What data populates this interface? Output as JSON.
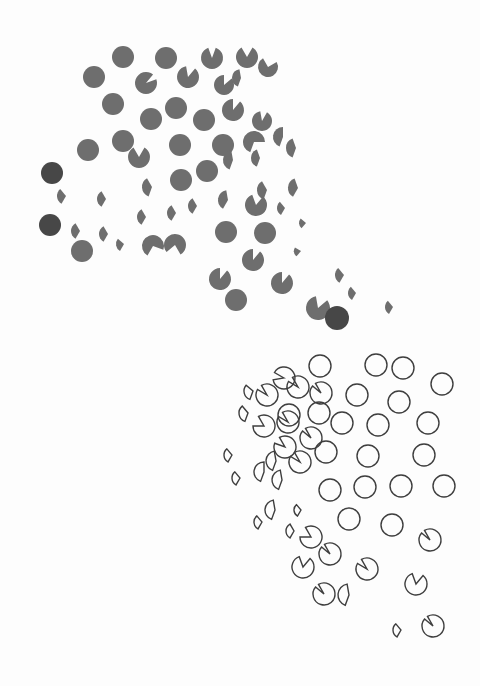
{
  "artwork": {
    "description": "Abstract composition: grey filled discs and pac-man sectors (upper-left) transitioning to outlined circles and sectors (lower-right)",
    "colors": {
      "background": "#fdfdfd",
      "fill": "#6e6e6e",
      "fill_dark": "#474747",
      "stroke": "#3e3e3e"
    },
    "filled_shapes": [
      {
        "cx": 123,
        "cy": 57,
        "r": 11,
        "start": 0,
        "sweep": 360
      },
      {
        "cx": 166,
        "cy": 58,
        "r": 11,
        "start": 0,
        "sweep": 360
      },
      {
        "cx": 212,
        "cy": 58,
        "r": 11,
        "start": 20,
        "sweep": 320
      },
      {
        "cx": 247,
        "cy": 57,
        "r": 11,
        "start": 30,
        "sweep": 300
      },
      {
        "cx": 268,
        "cy": 67,
        "r": 10,
        "start": 60,
        "sweep": 270
      },
      {
        "cx": 94,
        "cy": 77,
        "r": 11,
        "start": 0,
        "sweep": 360
      },
      {
        "cx": 146,
        "cy": 83,
        "r": 11,
        "start": 70,
        "sweep": 330
      },
      {
        "cx": 188,
        "cy": 77,
        "r": 11,
        "start": 40,
        "sweep": 310
      },
      {
        "cx": 224,
        "cy": 85,
        "r": 10,
        "start": 50,
        "sweep": 310
      },
      {
        "cx": 241,
        "cy": 78,
        "r": 9,
        "start": 200,
        "sweep": 150
      },
      {
        "cx": 113,
        "cy": 104,
        "r": 11,
        "start": 0,
        "sweep": 360
      },
      {
        "cx": 151,
        "cy": 119,
        "r": 11,
        "start": 0,
        "sweep": 360
      },
      {
        "cx": 176,
        "cy": 108,
        "r": 11,
        "start": 0,
        "sweep": 360
      },
      {
        "cx": 204,
        "cy": 120,
        "r": 11,
        "start": 0,
        "sweep": 360
      },
      {
        "cx": 233,
        "cy": 110,
        "r": 11,
        "start": 40,
        "sweep": 320
      },
      {
        "cx": 262,
        "cy": 121,
        "r": 10,
        "start": 30,
        "sweep": 320
      },
      {
        "cx": 123,
        "cy": 141,
        "r": 11,
        "start": 0,
        "sweep": 360
      },
      {
        "cx": 139,
        "cy": 157,
        "r": 11,
        "start": 30,
        "sweep": 300
      },
      {
        "cx": 88,
        "cy": 150,
        "r": 11,
        "start": 0,
        "sweep": 360
      },
      {
        "cx": 180,
        "cy": 145,
        "r": 11,
        "start": 0,
        "sweep": 360
      },
      {
        "cx": 223,
        "cy": 145,
        "r": 11,
        "start": 0,
        "sweep": 360
      },
      {
        "cx": 254,
        "cy": 142,
        "r": 11,
        "start": 200,
        "sweep": 250
      },
      {
        "cx": 283,
        "cy": 137,
        "r": 10,
        "start": 200,
        "sweep": 160
      },
      {
        "cx": 233,
        "cy": 160,
        "r": 10,
        "start": 200,
        "sweep": 150
      },
      {
        "cx": 260,
        "cy": 158,
        "r": 9,
        "start": 200,
        "sweep": 140
      },
      {
        "cx": 296,
        "cy": 148,
        "r": 10,
        "start": 200,
        "sweep": 140
      },
      {
        "cx": 207,
        "cy": 171,
        "r": 11,
        "start": 0,
        "sweep": 360
      },
      {
        "cx": 181,
        "cy": 180,
        "r": 11,
        "start": 0,
        "sweep": 360
      },
      {
        "cx": 152,
        "cy": 187,
        "r": 10,
        "start": 200,
        "sweep": 130
      },
      {
        "cx": 267,
        "cy": 190,
        "r": 10,
        "start": 200,
        "sweep": 130
      },
      {
        "cx": 228,
        "cy": 200,
        "r": 10,
        "start": 210,
        "sweep": 140
      },
      {
        "cx": 298,
        "cy": 188,
        "r": 10,
        "start": 210,
        "sweep": 130
      },
      {
        "cx": 256,
        "cy": 205,
        "r": 11,
        "start": 40,
        "sweep": 300
      },
      {
        "cx": 285,
        "cy": 208,
        "r": 8,
        "start": 210,
        "sweep": 110
      },
      {
        "cx": 66,
        "cy": 196,
        "r": 9,
        "start": 210,
        "sweep": 110
      },
      {
        "cx": 106,
        "cy": 199,
        "r": 9,
        "start": 210,
        "sweep": 120
      },
      {
        "cx": 146,
        "cy": 217,
        "r": 9,
        "start": 210,
        "sweep": 120
      },
      {
        "cx": 176,
        "cy": 213,
        "r": 9,
        "start": 210,
        "sweep": 120
      },
      {
        "cx": 197,
        "cy": 206,
        "r": 9,
        "start": 210,
        "sweep": 120
      },
      {
        "cx": 226,
        "cy": 232,
        "r": 11,
        "start": 0,
        "sweep": 360
      },
      {
        "cx": 265,
        "cy": 233,
        "r": 11,
        "start": 0,
        "sweep": 360
      },
      {
        "cx": 306,
        "cy": 223,
        "r": 7,
        "start": 220,
        "sweep": 90
      },
      {
        "cx": 108,
        "cy": 234,
        "r": 9,
        "start": 210,
        "sweep": 120
      },
      {
        "cx": 80,
        "cy": 231,
        "r": 9,
        "start": 210,
        "sweep": 120
      },
      {
        "cx": 124,
        "cy": 244,
        "r": 8,
        "start": 210,
        "sweep": 100
      },
      {
        "cx": 153,
        "cy": 246,
        "r": 11,
        "start": 210,
        "sweep": 260
      },
      {
        "cx": 175,
        "cy": 245,
        "r": 11,
        "start": 230,
        "sweep": 280
      },
      {
        "cx": 253,
        "cy": 260,
        "r": 11,
        "start": 40,
        "sweep": 320
      },
      {
        "cx": 301,
        "cy": 251,
        "r": 7,
        "start": 220,
        "sweep": 80
      },
      {
        "cx": 220,
        "cy": 279,
        "r": 11,
        "start": 40,
        "sweep": 320
      },
      {
        "cx": 282,
        "cy": 283,
        "r": 11,
        "start": 40,
        "sweep": 320
      },
      {
        "cx": 236,
        "cy": 300,
        "r": 11,
        "start": 0,
        "sweep": 360
      },
      {
        "cx": 344,
        "cy": 275,
        "r": 9,
        "start": 210,
        "sweep": 110
      },
      {
        "cx": 356,
        "cy": 293,
        "r": 8,
        "start": 210,
        "sweep": 110
      },
      {
        "cx": 393,
        "cy": 307,
        "r": 8,
        "start": 210,
        "sweep": 110
      },
      {
        "cx": 318,
        "cy": 308,
        "r": 12,
        "start": 50,
        "sweep": 300
      },
      {
        "cx": 337,
        "cy": 318,
        "r": 12,
        "start": 0,
        "sweep": 360,
        "dark": true
      },
      {
        "cx": 52,
        "cy": 173,
        "r": 11,
        "start": 0,
        "sweep": 360,
        "dark": true
      },
      {
        "cx": 50,
        "cy": 225,
        "r": 11,
        "start": 0,
        "sweep": 360,
        "dark": true
      },
      {
        "cx": 82,
        "cy": 251,
        "r": 11,
        "start": 0,
        "sweep": 360
      }
    ],
    "outline_shapes": [
      {
        "cx": 320,
        "cy": 366,
        "r": 11,
        "start": 300,
        "sweep": 360
      },
      {
        "cx": 376,
        "cy": 365,
        "r": 11,
        "start": 0,
        "sweep": 360
      },
      {
        "cx": 403,
        "cy": 368,
        "r": 11,
        "start": 0,
        "sweep": 360
      },
      {
        "cx": 442,
        "cy": 384,
        "r": 11,
        "start": 0,
        "sweep": 360
      },
      {
        "cx": 284,
        "cy": 378,
        "r": 11,
        "start": 300,
        "sweep": 320
      },
      {
        "cx": 298,
        "cy": 387,
        "r": 11,
        "start": 330,
        "sweep": 330
      },
      {
        "cx": 253,
        "cy": 391,
        "r": 9,
        "start": 200,
        "sweep": 110
      },
      {
        "cx": 267,
        "cy": 395,
        "r": 11,
        "start": 330,
        "sweep": 330
      },
      {
        "cx": 321,
        "cy": 393,
        "r": 11,
        "start": 330,
        "sweep": 340
      },
      {
        "cx": 357,
        "cy": 395,
        "r": 11,
        "start": 0,
        "sweep": 360
      },
      {
        "cx": 399,
        "cy": 402,
        "r": 11,
        "start": 0,
        "sweep": 360
      },
      {
        "cx": 289,
        "cy": 415,
        "r": 11,
        "start": 0,
        "sweep": 360
      },
      {
        "cx": 319,
        "cy": 413,
        "r": 11,
        "start": 0,
        "sweep": 360
      },
      {
        "cx": 378,
        "cy": 425,
        "r": 11,
        "start": 0,
        "sweep": 360
      },
      {
        "cx": 428,
        "cy": 423,
        "r": 11,
        "start": 0,
        "sweep": 360
      },
      {
        "cx": 248,
        "cy": 413,
        "r": 9,
        "start": 200,
        "sweep": 120
      },
      {
        "cx": 264,
        "cy": 426,
        "r": 11,
        "start": 330,
        "sweep": 300
      },
      {
        "cx": 288,
        "cy": 422,
        "r": 11,
        "start": 330,
        "sweep": 330
      },
      {
        "cx": 311,
        "cy": 438,
        "r": 11,
        "start": 330,
        "sweep": 340
      },
      {
        "cx": 342,
        "cy": 423,
        "r": 11,
        "start": 0,
        "sweep": 360
      },
      {
        "cx": 326,
        "cy": 452,
        "r": 11,
        "start": 0,
        "sweep": 360
      },
      {
        "cx": 368,
        "cy": 456,
        "r": 11,
        "start": 0,
        "sweep": 360
      },
      {
        "cx": 424,
        "cy": 455,
        "r": 11,
        "start": 0,
        "sweep": 360
      },
      {
        "cx": 285,
        "cy": 447,
        "r": 11,
        "start": 330,
        "sweep": 320
      },
      {
        "cx": 300,
        "cy": 462,
        "r": 11,
        "start": 330,
        "sweep": 330
      },
      {
        "cx": 276,
        "cy": 461,
        "r": 10,
        "start": 200,
        "sweep": 150
      },
      {
        "cx": 232,
        "cy": 455,
        "r": 8,
        "start": 210,
        "sweep": 110
      },
      {
        "cx": 264,
        "cy": 472,
        "r": 10,
        "start": 200,
        "sweep": 160
      },
      {
        "cx": 240,
        "cy": 478,
        "r": 8,
        "start": 210,
        "sweep": 110
      },
      {
        "cx": 282,
        "cy": 480,
        "r": 10,
        "start": 200,
        "sweep": 150
      },
      {
        "cx": 330,
        "cy": 490,
        "r": 11,
        "start": 0,
        "sweep": 360
      },
      {
        "cx": 365,
        "cy": 487,
        "r": 11,
        "start": 0,
        "sweep": 360
      },
      {
        "cx": 401,
        "cy": 486,
        "r": 11,
        "start": 0,
        "sweep": 360
      },
      {
        "cx": 444,
        "cy": 486,
        "r": 11,
        "start": 0,
        "sweep": 360
      },
      {
        "cx": 349,
        "cy": 519,
        "r": 11,
        "start": 0,
        "sweep": 360
      },
      {
        "cx": 392,
        "cy": 525,
        "r": 11,
        "start": 0,
        "sweep": 360
      },
      {
        "cx": 430,
        "cy": 540,
        "r": 11,
        "start": 330,
        "sweep": 340
      },
      {
        "cx": 275,
        "cy": 510,
        "r": 10,
        "start": 200,
        "sweep": 150
      },
      {
        "cx": 262,
        "cy": 522,
        "r": 8,
        "start": 210,
        "sweep": 110
      },
      {
        "cx": 301,
        "cy": 510,
        "r": 7,
        "start": 210,
        "sweep": 110
      },
      {
        "cx": 294,
        "cy": 531,
        "r": 8,
        "start": 210,
        "sweep": 120
      },
      {
        "cx": 311,
        "cy": 537,
        "r": 11,
        "start": 330,
        "sweep": 300
      },
      {
        "cx": 330,
        "cy": 554,
        "r": 11,
        "start": 330,
        "sweep": 340
      },
      {
        "cx": 303,
        "cy": 567,
        "r": 11,
        "start": 40,
        "sweep": 300
      },
      {
        "cx": 367,
        "cy": 569,
        "r": 11,
        "start": 330,
        "sweep": 330
      },
      {
        "cx": 416,
        "cy": 584,
        "r": 11,
        "start": 40,
        "sweep": 300
      },
      {
        "cx": 324,
        "cy": 594,
        "r": 11,
        "start": 330,
        "sweep": 340
      },
      {
        "cx": 349,
        "cy": 595,
        "r": 11,
        "start": 200,
        "sweep": 150
      },
      {
        "cx": 433,
        "cy": 626,
        "r": 11,
        "start": 330,
        "sweep": 340
      },
      {
        "cx": 401,
        "cy": 630,
        "r": 8,
        "start": 210,
        "sweep": 110
      }
    ]
  }
}
